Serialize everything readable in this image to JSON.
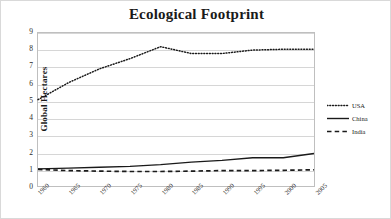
{
  "chart_data": {
    "type": "line",
    "title": "Ecological Footprint",
    "xlabel": "",
    "ylabel": "Global Hectares",
    "categories": [
      "1960",
      "1965",
      "1970",
      "1975",
      "1980",
      "1985",
      "1990",
      "1995",
      "2000",
      "2005"
    ],
    "ylim": [
      0,
      9
    ],
    "yticks": [
      "0",
      "1",
      "2",
      "3",
      "4",
      "5",
      "6",
      "7",
      "8",
      "9"
    ],
    "grid": true,
    "legend_position": "right",
    "series": [
      {
        "name": "USA",
        "style": "dotted",
        "color": "#1a1a1a",
        "values": [
          5.1,
          6.1,
          6.9,
          7.5,
          8.2,
          7.8,
          7.8,
          8.0,
          8.05,
          8.05
        ]
      },
      {
        "name": "China",
        "style": "solid",
        "color": "#1a1a1a",
        "values": [
          1.05,
          1.1,
          1.15,
          1.2,
          1.3,
          1.45,
          1.55,
          1.7,
          1.7,
          1.95
        ]
      },
      {
        "name": "India",
        "style": "dashed",
        "color": "#1a1a1a",
        "values": [
          1.02,
          0.95,
          0.92,
          0.9,
          0.9,
          0.92,
          0.95,
          0.95,
          0.97,
          1.0
        ]
      }
    ]
  },
  "legend": {
    "items": [
      {
        "label": "USA"
      },
      {
        "label": "China"
      },
      {
        "label": "India"
      }
    ]
  }
}
